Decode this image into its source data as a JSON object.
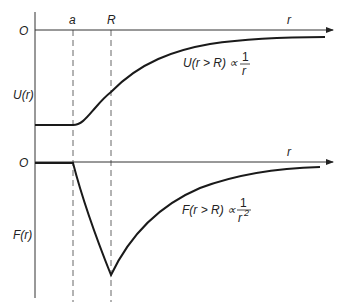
{
  "diagram": {
    "colors": {
      "line": "#1a1a1a",
      "axis": "#333333",
      "dashed": "#555555"
    },
    "top_plot": {
      "origin_label": "O",
      "x_axis_label": "r",
      "y_axis_label": "U(r)",
      "markers": [
        {
          "label": "a"
        },
        {
          "label": "R"
        }
      ],
      "annotation": {
        "left": "U(r > R) ∝",
        "numerator": "1",
        "denominator": "r"
      }
    },
    "bottom_plot": {
      "origin_label": "O",
      "x_axis_label": "r",
      "y_axis_label": "F(r)",
      "annotation": {
        "left": "F(r > R) ∝",
        "numerator": "1",
        "denominator": "r",
        "denominator_exponent": "2"
      }
    }
  }
}
